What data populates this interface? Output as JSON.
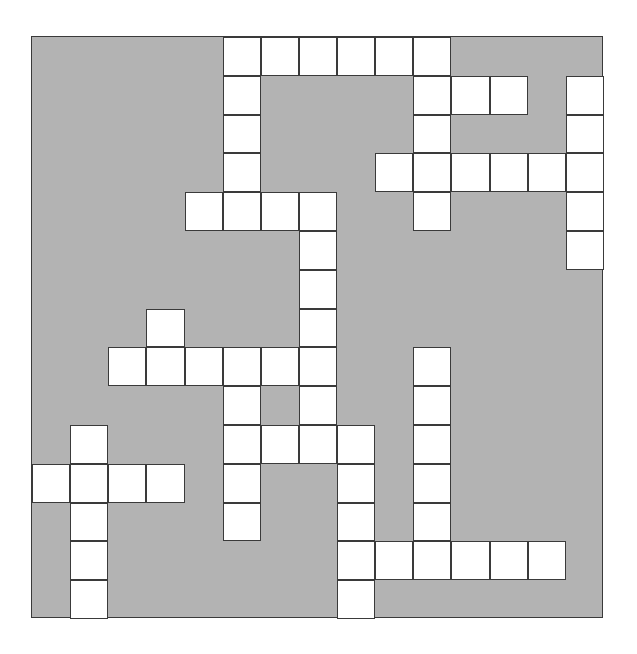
{
  "puzzle": {
    "type": "crossword-grid",
    "title": "",
    "rows": 15,
    "columns": 15,
    "cell_size_px": 38.13,
    "grid_origin_px": {
      "x": 31,
      "y": 36
    },
    "grid_size_px": {
      "width": 572,
      "height": 582
    },
    "colors": {
      "block_fill": "#b3b3b3",
      "open_fill": "#ffffff",
      "cell_border": "#3a3a3a",
      "page_background": "#ffffff"
    },
    "legend": {
      "open_cell": "white writable square",
      "block_cell": "gray blocked square"
    },
    "layout_note": "1 = open (white) cell, 0 = blocked (gray) cell",
    "grid": [
      [
        0,
        0,
        0,
        0,
        0,
        1,
        1,
        1,
        1,
        1,
        1,
        0,
        0,
        0,
        0
      ],
      [
        0,
        0,
        0,
        0,
        0,
        1,
        0,
        0,
        0,
        0,
        1,
        1,
        1,
        0,
        1
      ],
      [
        0,
        0,
        0,
        0,
        0,
        1,
        0,
        0,
        0,
        0,
        1,
        0,
        0,
        0,
        1
      ],
      [
        0,
        0,
        0,
        0,
        0,
        1,
        0,
        0,
        0,
        1,
        1,
        1,
        1,
        1,
        1
      ],
      [
        0,
        0,
        0,
        0,
        1,
        1,
        1,
        1,
        0,
        0,
        1,
        0,
        0,
        0,
        1
      ],
      [
        0,
        0,
        0,
        0,
        0,
        0,
        0,
        1,
        0,
        0,
        0,
        0,
        0,
        0,
        1
      ],
      [
        0,
        0,
        0,
        0,
        0,
        0,
        0,
        1,
        0,
        0,
        0,
        0,
        0,
        0,
        0
      ],
      [
        0,
        0,
        0,
        1,
        0,
        0,
        0,
        1,
        0,
        0,
        0,
        0,
        0,
        0,
        0
      ],
      [
        0,
        0,
        1,
        1,
        1,
        1,
        1,
        1,
        0,
        0,
        1,
        0,
        0,
        0,
        0
      ],
      [
        0,
        0,
        0,
        0,
        0,
        1,
        0,
        1,
        0,
        0,
        1,
        0,
        0,
        0,
        0
      ],
      [
        0,
        1,
        0,
        0,
        0,
        1,
        1,
        1,
        1,
        0,
        1,
        0,
        0,
        0,
        0
      ],
      [
        1,
        1,
        1,
        1,
        0,
        1,
        0,
        0,
        1,
        0,
        1,
        0,
        0,
        0,
        0
      ],
      [
        0,
        1,
        0,
        0,
        0,
        1,
        0,
        0,
        1,
        0,
        1,
        0,
        0,
        0,
        0
      ],
      [
        0,
        1,
        0,
        0,
        0,
        0,
        0,
        0,
        1,
        1,
        1,
        1,
        1,
        1,
        0
      ],
      [
        0,
        1,
        0,
        0,
        0,
        0,
        0,
        0,
        1,
        0,
        0,
        0,
        0,
        0,
        0
      ]
    ],
    "open_cell_count": 76,
    "block_cell_count": 149
  }
}
